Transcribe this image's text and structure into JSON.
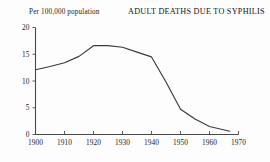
{
  "header": {
    "subtitle": "Per 100,000 population",
    "title": "ADULT DEATHS DUE TO SYPHILIS"
  },
  "axes": {
    "y_ticks": [
      "0",
      "5",
      "10",
      "15",
      "20"
    ],
    "x_ticks": [
      "1900",
      "1910",
      "1920",
      "1930",
      "1940",
      "1950",
      "1960",
      "1970"
    ]
  },
  "colors": {
    "line": "#3a3a3a",
    "axis": "#4a4a4a",
    "background": "#fdfdfd",
    "text": "#1b1b1b"
  },
  "chart_data": {
    "type": "line",
    "title": "ADULT DEATHS DUE TO SYPHILIS",
    "subtitle": "Per 100,000 population",
    "xlabel": "",
    "ylabel": "Per 100,000 population",
    "xlim": [
      1900,
      1970
    ],
    "ylim": [
      0,
      20
    ],
    "xticks": [
      1900,
      1910,
      1920,
      1930,
      1940,
      1950,
      1960,
      1970
    ],
    "yticks": [
      0,
      5,
      10,
      15,
      20
    ],
    "grid": false,
    "legend": false,
    "series": [
      {
        "name": "Adult deaths due to syphilis",
        "x": [
          1900,
          1905,
          1910,
          1915,
          1920,
          1925,
          1930,
          1935,
          1940,
          1945,
          1950,
          1955,
          1960,
          1967
        ],
        "values": [
          12.1,
          12.7,
          13.4,
          14.6,
          16.6,
          16.6,
          16.3,
          15.4,
          14.5,
          9.8,
          4.7,
          2.9,
          1.5,
          0.6
        ]
      }
    ]
  }
}
